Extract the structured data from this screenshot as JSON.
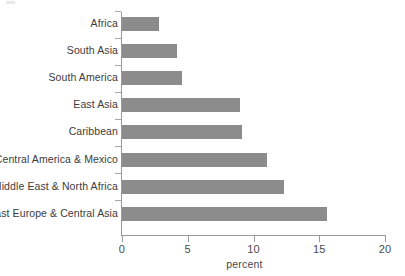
{
  "chart_data": {
    "type": "bar",
    "orientation": "horizontal",
    "title": "",
    "xlabel": "percent",
    "ylabel": "",
    "xlim": [
      0,
      20
    ],
    "xticks": [
      "0",
      "5",
      "10",
      "15",
      "20"
    ],
    "xtick_values": [
      0,
      5,
      10,
      15,
      20
    ],
    "grid": false,
    "legend": "none",
    "bar_color": "#8c8c8c",
    "axis_color": "#9a9a9a",
    "text_color": "#3c3c3c",
    "categories": [
      "Africa",
      "South Asia",
      "South America",
      "East Asia",
      "Caribbean",
      "Central America & Mexico",
      "Middle East & North Africa",
      "East Europe & Central Asia"
    ],
    "values": [
      2.8,
      4.2,
      4.6,
      9.0,
      9.1,
      11.0,
      12.3,
      15.6
    ],
    "series": [
      {
        "name": "percent",
        "values": [
          2.8,
          4.2,
          4.6,
          9.0,
          9.1,
          11.0,
          12.3,
          15.6
        ]
      }
    ]
  }
}
